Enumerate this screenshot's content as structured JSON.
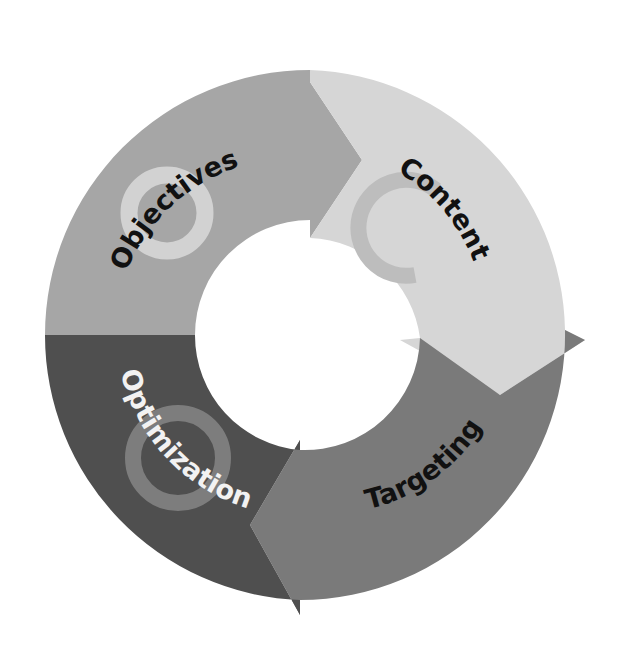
{
  "diagram": {
    "type": "cycle",
    "segments": [
      {
        "label": "Objectives",
        "fill": "#a6a6a6",
        "text_color": "#111111",
        "ring_color": "#d2d2d2"
      },
      {
        "label": "Content",
        "fill": "#d6d6d6",
        "text_color": "#111111",
        "ring_color": "#bdbdbd"
      },
      {
        "label": "Targeting",
        "fill": "#7a7a7a",
        "text_color": "#111111"
      },
      {
        "label": "Optimization",
        "fill": "#4f4f4f",
        "text_color": "#f2f2f2",
        "ring_color": "#7d7d7d"
      }
    ]
  }
}
